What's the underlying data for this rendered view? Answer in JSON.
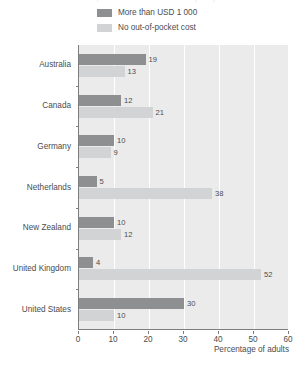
{
  "title_sliver": "Out-of-pocket medical costs in the past year",
  "legend": {
    "items": [
      {
        "label": "More than USD 1 000",
        "color": "#8e8f91",
        "swatch_name": "legend-swatch-dark"
      },
      {
        "label": "No out-of-pocket cost",
        "color": "#d2d3d4",
        "swatch_name": "legend-swatch-light"
      }
    ]
  },
  "chart_data": {
    "type": "bar",
    "orientation": "horizontal",
    "title": "",
    "xlabel": "Percentage of adults",
    "ylabel": "",
    "xlim": [
      0,
      60
    ],
    "xticks": [
      0,
      10,
      20,
      30,
      40,
      50,
      60
    ],
    "grid": true,
    "legend_position": "top",
    "categories": [
      "Australia",
      "Canada",
      "Germany",
      "Netherlands",
      "New Zealand",
      "United Kingdom",
      "United States"
    ],
    "series": [
      {
        "name": "More than USD 1 000",
        "color": "#8e8f91",
        "values": [
          19,
          12,
          10,
          5,
          10,
          4,
          30
        ]
      },
      {
        "name": "No out-of-pocket cost",
        "color": "#d2d3d4",
        "values": [
          13,
          21,
          9,
          38,
          12,
          52,
          10
        ]
      }
    ]
  },
  "colors": {
    "plot_background": "#ebebeb",
    "gridline": "#ffffff",
    "axis": "#7c7d7f",
    "text": "#4b4c4e"
  }
}
